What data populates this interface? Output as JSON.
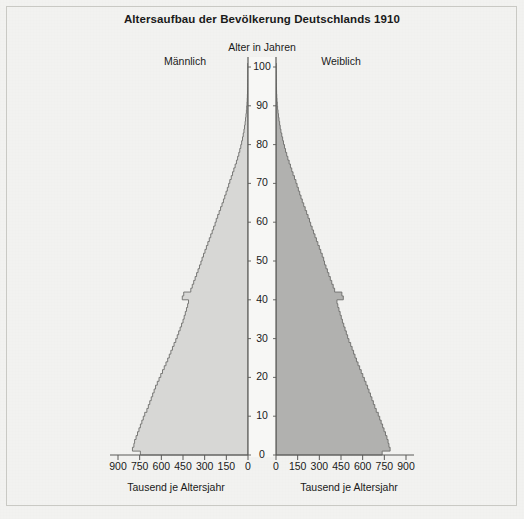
{
  "chart_data": {
    "type": "bar",
    "orientation": "horizontal",
    "subtype": "population-pyramid",
    "title": "Altersaufbau der Bevölkerung Deutschlands 1910",
    "center_axis_label": "Alter in Jahren",
    "xlabel_left": "Tausend je Altersjahr",
    "xlabel_right": "Tausend je Altersjahr",
    "ylabel": "Alter in Jahren",
    "legend": [
      "Männlich",
      "Weiblich"
    ],
    "legend_position": "top",
    "grid": false,
    "xlim": [
      0,
      900
    ],
    "ylim": [
      0,
      100
    ],
    "x_ticks_left": [
      "900",
      "750",
      "600",
      "450",
      "300",
      "150",
      "0"
    ],
    "x_ticks_right": [
      "0",
      "150",
      "300",
      "450",
      "600",
      "750",
      "900"
    ],
    "x_tick_values": [
      0,
      150,
      300,
      450,
      600,
      750,
      900
    ],
    "y_ticks": [
      "0",
      "10",
      "20",
      "30",
      "40",
      "50",
      "60",
      "70",
      "80",
      "90",
      "100"
    ],
    "y_tick_values": [
      0,
      10,
      20,
      30,
      40,
      50,
      60,
      70,
      80,
      90,
      100
    ],
    "ages": [
      0,
      1,
      2,
      3,
      4,
      5,
      6,
      7,
      8,
      9,
      10,
      11,
      12,
      13,
      14,
      15,
      16,
      17,
      18,
      19,
      20,
      21,
      22,
      23,
      24,
      25,
      26,
      27,
      28,
      29,
      30,
      31,
      32,
      33,
      34,
      35,
      36,
      37,
      38,
      39,
      40,
      41,
      42,
      43,
      44,
      45,
      46,
      47,
      48,
      49,
      50,
      51,
      52,
      53,
      54,
      55,
      56,
      57,
      58,
      59,
      60,
      61,
      62,
      63,
      64,
      65,
      66,
      67,
      68,
      69,
      70,
      71,
      72,
      73,
      74,
      75,
      76,
      77,
      78,
      79,
      80,
      81,
      82,
      83,
      84,
      85,
      86,
      87,
      88,
      89,
      90,
      91,
      92,
      93,
      94,
      95,
      96,
      97,
      98,
      99,
      100
    ],
    "series": [
      {
        "name": "Männlich",
        "color": "#d7d7d5",
        "side": "left",
        "values": [
          745,
          800,
          790,
          785,
          775,
          765,
          755,
          745,
          735,
          725,
          715,
          700,
          690,
          680,
          670,
          660,
          650,
          640,
          628,
          616,
          604,
          592,
          580,
          568,
          556,
          545,
          534,
          523,
          512,
          500,
          490,
          480,
          470,
          460,
          450,
          442,
          434,
          426,
          418,
          412,
          455,
          445,
          396,
          386,
          376,
          366,
          356,
          346,
          336,
          326,
          318,
          308,
          298,
          288,
          278,
          268,
          258,
          248,
          238,
          228,
          220,
          210,
          200,
          190,
          180,
          170,
          161,
          152,
          143,
          134,
          126,
          116,
          107,
          98,
          89,
          80,
          72,
          64,
          57,
          50,
          44,
          38,
          33,
          28,
          24,
          20,
          17,
          14,
          11,
          9,
          7,
          5.5,
          4.2,
          3.2,
          2.4,
          1.8,
          1.3,
          0.9,
          0.6,
          0.4,
          0.2
        ]
      },
      {
        "name": "Weiblich",
        "color": "#b1b1af",
        "side": "right",
        "values": [
          735,
          790,
          782,
          776,
          768,
          758,
          748,
          738,
          728,
          718,
          708,
          694,
          684,
          674,
          664,
          654,
          644,
          634,
          623,
          612,
          601,
          590,
          579,
          568,
          557,
          547,
          537,
          527,
          517,
          505,
          496,
          487,
          478,
          469,
          460,
          452,
          444,
          436,
          428,
          422,
          466,
          456,
          406,
          396,
          386,
          376,
          366,
          356,
          346,
          336,
          330,
          320,
          310,
          300,
          290,
          280,
          270,
          260,
          250,
          240,
          232,
          222,
          212,
          202,
          192,
          182,
          173,
          164,
          155,
          146,
          138,
          128,
          118,
          109,
          100,
          91,
          82,
          74,
          66,
          59,
          52,
          46,
          40,
          34,
          29,
          25,
          21,
          17,
          14,
          11,
          9,
          7,
          5.4,
          4.1,
          3.1,
          2.3,
          1.7,
          1.2,
          0.8,
          0.5,
          0.3
        ]
      }
    ]
  },
  "style": {
    "background": "#f2f2f0",
    "axis_color": "#5a5a58",
    "text_color": "#1a1a1a",
    "center_channel": "#f7f7f5",
    "male_color": "#d7d7d5",
    "female_color": "#b1b1af"
  }
}
